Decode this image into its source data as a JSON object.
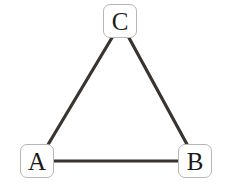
{
  "diagram": {
    "type": "undirected-graph",
    "title": "",
    "background_color": "#ffffff",
    "edge_color": "#3a332e",
    "node_border_color": "#b9b5b0",
    "node_fill_color": "#ffffff",
    "node_label_color": "#1a1a1a",
    "nodes": [
      {
        "id": "C",
        "label": "C",
        "x": 120,
        "y": 21,
        "shape": "rounded-rectangle"
      },
      {
        "id": "A",
        "label": "A",
        "x": 37,
        "y": 161,
        "shape": "rounded-rectangle"
      },
      {
        "id": "B",
        "label": "B",
        "x": 195,
        "y": 161,
        "shape": "rounded-rectangle"
      }
    ],
    "edges": [
      {
        "id": "edge-a-c",
        "from": "A",
        "to": "C",
        "label": "",
        "x1": 46,
        "y1": 148,
        "x2": 113,
        "y2": 36
      },
      {
        "id": "edge-c-b",
        "from": "C",
        "to": "B",
        "label": "",
        "x1": 128,
        "y1": 36,
        "x2": 189,
        "y2": 148
      },
      {
        "id": "edge-a-b",
        "from": "A",
        "to": "B",
        "label": "",
        "x1": 54,
        "y1": 161,
        "x2": 178,
        "y2": 161
      }
    ]
  }
}
